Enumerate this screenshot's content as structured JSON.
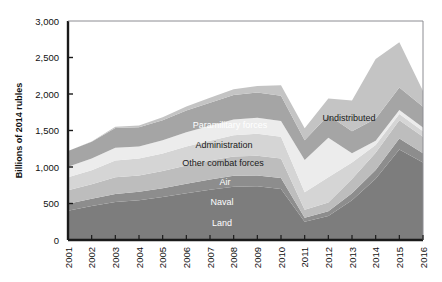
{
  "chart_data": {
    "type": "area",
    "stacked": true,
    "title": "",
    "subtitle": "",
    "xlabel": "",
    "ylabel": "Billions of 2014 rubles",
    "x": [
      2001,
      2002,
      2003,
      2004,
      2005,
      2006,
      2007,
      2008,
      2009,
      2010,
      2011,
      2012,
      2013,
      2014,
      2015,
      2016
    ],
    "categories": [
      "2001",
      "2002",
      "2003",
      "2004",
      "2005",
      "2006",
      "2007",
      "2008",
      "2009",
      "2010",
      "2011",
      "2012",
      "2013",
      "2014",
      "2015",
      "2016"
    ],
    "xlim": [
      2001,
      2016
    ],
    "ylim": [
      0,
      3000
    ],
    "yticks": [
      0,
      500,
      1000,
      1500,
      2000,
      2500,
      3000
    ],
    "ytick_labels": [
      "0",
      "500",
      "1,000",
      "1,500",
      "2,000",
      "2,500",
      "3,000"
    ],
    "xtick_labels": [
      "2001",
      "2002",
      "2003",
      "2004",
      "2005",
      "2006",
      "2007",
      "2008",
      "2009",
      "2010",
      "2011",
      "2012",
      "2013",
      "2014",
      "2015",
      "2016"
    ],
    "grid": false,
    "legend": "in-plot-labels",
    "series": [
      {
        "name": "Land",
        "color": "#7d7d7d",
        "values": [
          400,
          465,
          520,
          545,
          590,
          640,
          690,
          730,
          735,
          700,
          250,
          330,
          545,
          840,
          1240,
          1060
        ]
      },
      {
        "name": "Naval",
        "color": "#8d8d8d",
        "values": [
          95,
          100,
          110,
          115,
          120,
          130,
          140,
          150,
          150,
          150,
          55,
          65,
          95,
          120,
          150,
          130
        ]
      },
      {
        "name": "Air",
        "color": "#bdbdbd",
        "values": [
          185,
          200,
          230,
          225,
          235,
          250,
          260,
          265,
          270,
          265,
          110,
          120,
          195,
          235,
          250,
          225
        ]
      },
      {
        "name": "Other combat forces",
        "color": "#d5d5d5",
        "values": [
          180,
          190,
          230,
          230,
          240,
          260,
          270,
          290,
          300,
          300,
          240,
          345,
          225,
          105,
          85,
          75
        ]
      },
      {
        "name": "Administration",
        "color": "#ececec",
        "values": [
          145,
          160,
          175,
          165,
          180,
          195,
          205,
          215,
          220,
          215,
          440,
          540,
          130,
          60,
          55,
          50
        ]
      },
      {
        "name": "Paramilitary forces",
        "color": "#a5a5a5",
        "values": [
          215,
          230,
          270,
          265,
          275,
          300,
          315,
          335,
          345,
          345,
          270,
          310,
          300,
          300,
          310,
          285
        ]
      },
      {
        "name": "Undistributed",
        "color": "#c4c4c4",
        "values": [
          0,
          5,
          15,
          25,
          40,
          55,
          70,
          80,
          90,
          145,
          165,
          230,
          420,
          820,
          620,
          215
        ]
      }
    ],
    "series_labels": [
      {
        "name": "Undistributed",
        "text": "Undistributed",
        "x": 349,
        "y": 121,
        "style": "dark",
        "anchor": "middle"
      },
      {
        "name": "Paramilitary forces",
        "text": "Paramilitary forces",
        "x": 230,
        "y": 128,
        "style": "light",
        "anchor": "middle"
      },
      {
        "name": "Administration",
        "text": "Administration",
        "x": 224,
        "y": 148,
        "style": "dark",
        "anchor": "middle"
      },
      {
        "name": "Other combat forces",
        "text": "Other combat forces",
        "x": 223,
        "y": 166,
        "style": "dark",
        "anchor": "middle"
      },
      {
        "name": "Air",
        "text": "Air",
        "x": 225,
        "y": 185,
        "style": "light",
        "anchor": "middle"
      },
      {
        "name": "Naval",
        "text": "Naval",
        "x": 222,
        "y": 205,
        "style": "light",
        "anchor": "middle"
      },
      {
        "name": "Land",
        "text": "Land",
        "x": 222,
        "y": 226,
        "style": "light",
        "anchor": "middle"
      }
    ]
  }
}
